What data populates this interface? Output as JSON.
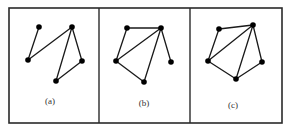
{
  "figure": {
    "frame": {
      "x": 9,
      "y": 8,
      "width": 273,
      "height": 115
    },
    "dividers": [
      99,
      190
    ],
    "node_radius": 2.8,
    "colors": {
      "stroke": "#2a2a2a",
      "edge": "#1a1a1a",
      "node": "#000000",
      "label": "#333333"
    },
    "panels": [
      {
        "label": "(a)",
        "label_pos": {
          "x": 50,
          "y": 104
        },
        "nodes": [
          {
            "id": "1",
            "x": 39,
            "y": 27
          },
          {
            "id": "2",
            "x": 72,
            "y": 27
          },
          {
            "id": "3",
            "x": 28,
            "y": 60
          },
          {
            "id": "4",
            "x": 82,
            "y": 61
          },
          {
            "id": "5",
            "x": 56,
            "y": 81
          }
        ],
        "edges": [
          [
            "1",
            "3"
          ],
          [
            "3",
            "2"
          ],
          [
            "2",
            "5"
          ],
          [
            "2",
            "4"
          ],
          [
            "4",
            "5"
          ]
        ]
      },
      {
        "label": "(b)",
        "label_pos": {
          "x": 144,
          "y": 106
        },
        "nodes": [
          {
            "id": "1",
            "x": 127,
            "y": 28
          },
          {
            "id": "2",
            "x": 161,
            "y": 28
          },
          {
            "id": "3",
            "x": 116,
            "y": 61
          },
          {
            "id": "4",
            "x": 171,
            "y": 62
          },
          {
            "id": "5",
            "x": 144,
            "y": 82
          }
        ],
        "edges": [
          [
            "1",
            "2"
          ],
          [
            "1",
            "3"
          ],
          [
            "3",
            "2"
          ],
          [
            "2",
            "5"
          ],
          [
            "2",
            "4"
          ],
          [
            "3",
            "5"
          ]
        ]
      },
      {
        "label": "(c)",
        "label_pos": {
          "x": 233,
          "y": 108
        },
        "nodes": [
          {
            "id": "1",
            "x": 219,
            "y": 29
          },
          {
            "id": "2",
            "x": 253,
            "y": 25
          },
          {
            "id": "3",
            "x": 208,
            "y": 61
          },
          {
            "id": "4",
            "x": 262,
            "y": 62
          },
          {
            "id": "5",
            "x": 236,
            "y": 79
          }
        ],
        "edges": [
          [
            "1",
            "2"
          ],
          [
            "1",
            "3"
          ],
          [
            "3",
            "2"
          ],
          [
            "2",
            "5"
          ],
          [
            "2",
            "4"
          ],
          [
            "3",
            "5"
          ],
          [
            "4",
            "5"
          ]
        ]
      }
    ]
  }
}
